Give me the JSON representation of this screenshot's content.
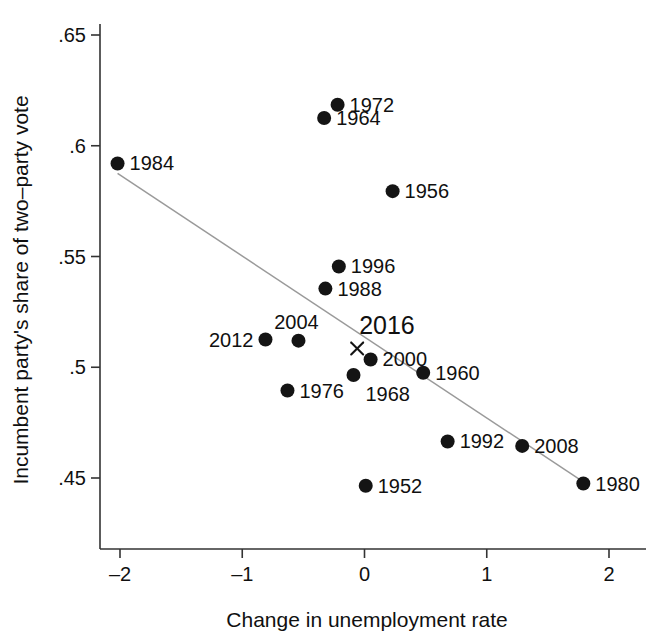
{
  "chart_data": {
    "type": "scatter",
    "title": "",
    "xlabel": "Change in unemployment rate",
    "ylabel": "Incumbent party's share of two–party vote",
    "xlim": [
      -2.25,
      2.25
    ],
    "ylim": [
      0.4375,
      0.655
    ],
    "grid": false,
    "legend": null,
    "xticks": [
      -2,
      -1,
      0,
      1,
      2
    ],
    "xticklabels": [
      "–2",
      "–1",
      "0",
      "1",
      "2"
    ],
    "yticks": [
      0.45,
      0.5,
      0.55,
      0.6,
      0.65
    ],
    "yticklabels": [
      ".45",
      ".5",
      ".55",
      ".6",
      ".65"
    ],
    "point_label_field": "year",
    "points": [
      {
        "year": "1984",
        "x": -2.02,
        "y": 0.592,
        "marker": "dot",
        "label_pos": "right"
      },
      {
        "year": "1972",
        "x": -0.22,
        "y": 0.6185,
        "marker": "dot",
        "label_pos": "right"
      },
      {
        "year": "1964",
        "x": -0.33,
        "y": 0.6125,
        "marker": "dot",
        "label_pos": "right"
      },
      {
        "year": "1956",
        "x": 0.23,
        "y": 0.5795,
        "marker": "dot",
        "label_pos": "right"
      },
      {
        "year": "1996",
        "x": -0.21,
        "y": 0.5455,
        "marker": "dot",
        "label_pos": "right"
      },
      {
        "year": "1988",
        "x": -0.32,
        "y": 0.5355,
        "marker": "dot",
        "label_pos": "right"
      },
      {
        "year": "2012",
        "x": -0.81,
        "y": 0.5125,
        "marker": "dot",
        "label_pos": "left"
      },
      {
        "year": "2004",
        "x": -0.54,
        "y": 0.512,
        "marker": "dot",
        "label_pos": "above"
      },
      {
        "year": "2016",
        "x": -0.06,
        "y": 0.5085,
        "marker": "x",
        "label_pos": "above",
        "emphasis": true
      },
      {
        "year": "2000",
        "x": 0.05,
        "y": 0.5035,
        "marker": "dot",
        "label_pos": "right"
      },
      {
        "year": "1960",
        "x": 0.48,
        "y": 0.4975,
        "marker": "dot",
        "label_pos": "right"
      },
      {
        "year": "1968",
        "x": -0.09,
        "y": 0.4965,
        "marker": "dot",
        "label_pos": "belowright"
      },
      {
        "year": "1976",
        "x": -0.63,
        "y": 0.4895,
        "marker": "dot",
        "label_pos": "right"
      },
      {
        "year": "1992",
        "x": 0.68,
        "y": 0.4665,
        "marker": "dot",
        "label_pos": "right"
      },
      {
        "year": "2008",
        "x": 1.29,
        "y": 0.4645,
        "marker": "dot",
        "label_pos": "right"
      },
      {
        "year": "1952",
        "x": 0.01,
        "y": 0.4465,
        "marker": "dot",
        "label_pos": "right"
      },
      {
        "year": "1980",
        "x": 1.79,
        "y": 0.4475,
        "marker": "dot",
        "label_pos": "right"
      }
    ],
    "fit_line": {
      "style": "solid",
      "color": "#9a9a9a",
      "x0": -2.02,
      "y0": 0.5875,
      "x1": 1.83,
      "y1": 0.4468
    }
  }
}
